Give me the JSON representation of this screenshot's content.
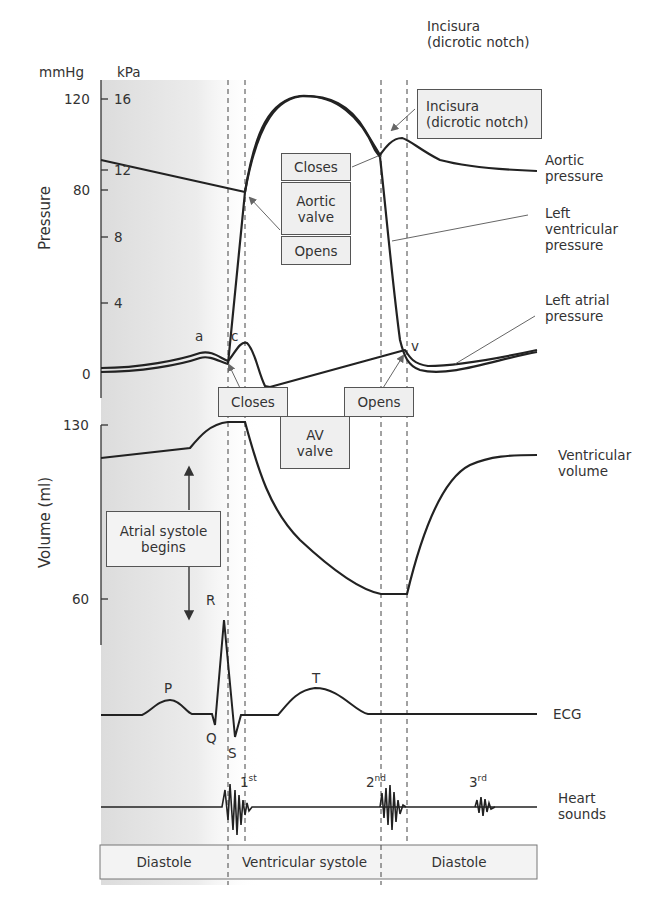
{
  "title_note": "Incisura\n(dicrotic notch)",
  "axes": {
    "pressure": {
      "title": "Pressure",
      "unit_left": "mmHg",
      "unit_right": "kPa",
      "mmhg_ticks": [
        "120",
        "80",
        "0"
      ],
      "kpa_ticks": [
        "16",
        "12",
        "8",
        "4"
      ]
    },
    "volume": {
      "title": "Volume (ml)",
      "ticks": [
        "130",
        "60"
      ]
    }
  },
  "curve_labels": {
    "aortic_pressure": "Aortic\npressure",
    "lv_pressure": "Left\nventricular\npressure",
    "la_pressure": "Left atrial\npressure",
    "ventricular_volume": "Ventricular\nvolume",
    "ecg": "ECG",
    "heart_sounds": "Heart\nsounds"
  },
  "waves": {
    "a": "a",
    "c": "c",
    "v": "v",
    "P": "P",
    "Q": "Q",
    "R": "R",
    "S": "S",
    "T": "T"
  },
  "heart_sound_labels": [
    {
      "num": "1",
      "sup": "st"
    },
    {
      "num": "2",
      "sup": "nd"
    },
    {
      "num": "3",
      "sup": "rd"
    }
  ],
  "boxes": {
    "incisura": "Incisura\n(dicrotic notch)",
    "aortic_closes": "Closes",
    "aortic_valve": "Aortic\nvalve",
    "aortic_opens": "Opens",
    "av_closes": "Closes",
    "av_valve": "AV\nvalve",
    "av_opens": "Opens",
    "atrial_systole": "Atrial systole\nbegins"
  },
  "phases": [
    "Diastole",
    "Ventricular systole",
    "Diastole"
  ],
  "colors": {
    "line": "#222222",
    "box_fill": "#efefef",
    "shade": "#e4e4e4"
  }
}
